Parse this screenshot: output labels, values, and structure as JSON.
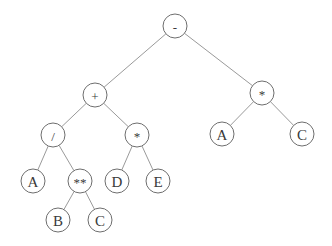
{
  "diagram": {
    "type": "expression-tree",
    "nodes": [
      {
        "id": "n0",
        "label": "-",
        "x": 175,
        "y": 26,
        "kind": "op"
      },
      {
        "id": "n1",
        "label": "+",
        "x": 95,
        "y": 95,
        "kind": "op"
      },
      {
        "id": "n2",
        "label": "*",
        "x": 262,
        "y": 93,
        "kind": "op"
      },
      {
        "id": "n3",
        "label": "/",
        "x": 53,
        "y": 135,
        "kind": "op"
      },
      {
        "id": "n4",
        "label": "*",
        "x": 137,
        "y": 135,
        "kind": "op"
      },
      {
        "id": "n5",
        "label": "A",
        "x": 222,
        "y": 134,
        "kind": "leaf"
      },
      {
        "id": "n6",
        "label": "C",
        "x": 302,
        "y": 134,
        "kind": "leaf"
      },
      {
        "id": "n7",
        "label": "A",
        "x": 33,
        "y": 181,
        "kind": "leaf"
      },
      {
        "id": "n8",
        "label": "**",
        "x": 80,
        "y": 181,
        "kind": "op"
      },
      {
        "id": "n9",
        "label": "D",
        "x": 117,
        "y": 181,
        "kind": "leaf"
      },
      {
        "id": "n10",
        "label": "E",
        "x": 158,
        "y": 181,
        "kind": "leaf"
      },
      {
        "id": "n11",
        "label": "B",
        "x": 58,
        "y": 220,
        "kind": "leaf"
      },
      {
        "id": "n12",
        "label": "C",
        "x": 100,
        "y": 220,
        "kind": "leaf"
      }
    ],
    "edges": [
      [
        "n0",
        "n1"
      ],
      [
        "n0",
        "n2"
      ],
      [
        "n1",
        "n3"
      ],
      [
        "n1",
        "n4"
      ],
      [
        "n2",
        "n5"
      ],
      [
        "n2",
        "n6"
      ],
      [
        "n3",
        "n7"
      ],
      [
        "n3",
        "n8"
      ],
      [
        "n4",
        "n9"
      ],
      [
        "n4",
        "n10"
      ],
      [
        "n8",
        "n11"
      ],
      [
        "n8",
        "n12"
      ]
    ],
    "node_radius": 12,
    "colors": {
      "edge": "#9a9a9a",
      "node_stroke": "#6e6e6e",
      "label": "#3a3a3a",
      "background": "#ffffff"
    }
  }
}
